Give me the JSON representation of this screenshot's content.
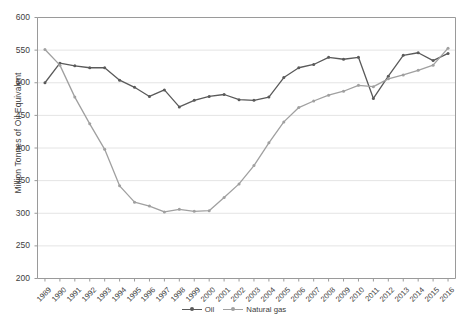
{
  "chart_data": {
    "type": "line",
    "title": "",
    "xlabel": "",
    "ylabel": "Million Tonnes of Oil Equivalent",
    "ylim": [
      200,
      600
    ],
    "ytick_step": 50,
    "yticks": [
      200,
      250,
      300,
      350,
      400,
      450,
      500,
      550,
      600
    ],
    "grid": "horizontal",
    "legend_position": "bottom",
    "categories": [
      "1989",
      "1990",
      "1991",
      "1992",
      "1993",
      "1994",
      "1995",
      "1996",
      "1997",
      "1998",
      "1999",
      "2000",
      "2001",
      "2002",
      "2003",
      "2004",
      "2005",
      "2006",
      "2007",
      "2008",
      "2009",
      "2010",
      "2011",
      "2012",
      "2013",
      "2014",
      "2015",
      "2016"
    ],
    "series": [
      {
        "name": "Oil",
        "color": "#5a5a5a",
        "values": [
          500,
          530,
          526,
          523,
          523,
          504,
          493,
          479,
          489,
          463,
          473,
          479,
          482,
          474,
          473,
          478,
          508,
          523,
          528,
          539,
          536,
          539,
          476,
          510,
          542,
          546,
          534,
          545
        ]
      },
      {
        "name": "Natural gas",
        "color": "#a0a0a0",
        "values": [
          551,
          527,
          478,
          437,
          398,
          342,
          317,
          311,
          302,
          306,
          303,
          304,
          324,
          345,
          373,
          408,
          440,
          462,
          472,
          481,
          487,
          496,
          494,
          506,
          512,
          519,
          527,
          553
        ]
      }
    ]
  },
  "legend": {
    "items": [
      {
        "label": "Oil"
      },
      {
        "label": "Natural gas"
      }
    ]
  },
  "axes": {
    "y_title": "Million Tonnes of Oil Equivalent"
  }
}
